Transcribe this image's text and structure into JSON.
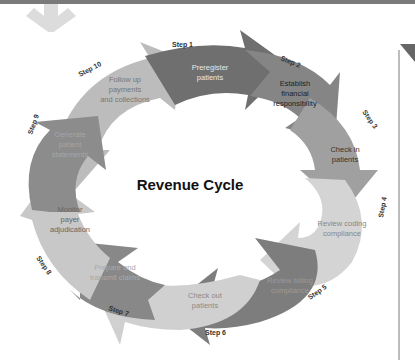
{
  "diagram": {
    "title": "Revenue Cycle",
    "steps": [
      {
        "step": "Step 1",
        "label_lines": [
          "Preregister",
          "patients"
        ],
        "color": "#6f6f6f",
        "text_color": "#e8e8e8"
      },
      {
        "step": "Step 2",
        "label_lines": [
          "Establish",
          "financial",
          "responsibility"
        ],
        "color": "#858585",
        "text_color": "#222222"
      },
      {
        "step": "Step 3",
        "label_lines": [
          "Check in",
          "patients"
        ],
        "color": "#a0a0a0",
        "text_color": "#333333"
      },
      {
        "step": "Step 4",
        "label_lines": [
          "Review coding",
          "compliance"
        ],
        "color": "#d4d4d4",
        "text_color": "#888888"
      },
      {
        "step": "Step 5",
        "label_lines": [
          "Review billing",
          "compliance"
        ],
        "color": "#7d7d7d",
        "text_color": "#9a9a9a"
      },
      {
        "step": "Step 6",
        "label_lines": [
          "Check out",
          "patients"
        ],
        "color": "#d0d0d0",
        "text_color": "#8a8a8a"
      },
      {
        "step": "Step 7",
        "label_lines": [
          "Prepare and",
          "transmit claims"
        ],
        "color": "#888888",
        "text_color": "#a8a8a8"
      },
      {
        "step": "Step 8",
        "label_lines": [
          "Monitor",
          "payer",
          "adjudication"
        ],
        "color": "#c8c8c8",
        "text_color": "#666666"
      },
      {
        "step": "Step 9",
        "label_lines": [
          "Generate",
          "patient",
          "statements"
        ],
        "color": "#8c8c8c",
        "text_color": "#a5a5a5"
      },
      {
        "step": "Step 10",
        "label_lines": [
          "Follow up",
          "payments",
          "and collections"
        ],
        "color": "#bcbcbc",
        "text_color": "#777777"
      }
    ]
  },
  "decor": {
    "down_arrow_icon": "down-arrow",
    "right_chevron_icon": "chevron-right"
  }
}
